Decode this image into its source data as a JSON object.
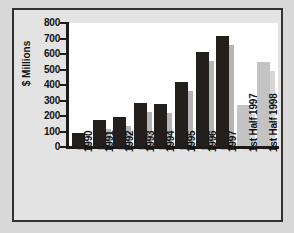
{
  "chart_data": {
    "type": "bar",
    "title": "",
    "xlabel": "",
    "ylabel": "$ Millions",
    "ylim": [
      0,
      800
    ],
    "ytick_labels": [
      "800",
      "700",
      "600",
      "500",
      "400",
      "300",
      "200",
      "100",
      "0"
    ],
    "yticks": [
      800,
      700,
      600,
      500,
      400,
      300,
      200,
      100,
      0
    ],
    "grid": false,
    "legend": "none",
    "categories": [
      "1990",
      "1991",
      "1992",
      "1993",
      "1994",
      "1995",
      "1996",
      "1997",
      "1st Half 1997",
      "1st Half 1998"
    ],
    "values": [
      90,
      175,
      195,
      285,
      278,
      420,
      615,
      715,
      270,
      550
    ],
    "bar_styles": [
      "dark",
      "dark",
      "dark",
      "dark",
      "dark",
      "dark",
      "dark",
      "dark",
      "light",
      "light"
    ],
    "series": [
      {
        "name": "Revenue",
        "values": [
          90,
          175,
          195,
          285,
          278,
          420,
          615,
          715,
          270,
          550
        ]
      }
    ]
  },
  "colors": {
    "bar_dark": "#231f1d",
    "bar_light": "#c3c3c3",
    "shadow_dark": "#b4b4b4",
    "shadow_light": "#d6d6d6",
    "axis": "#1d1a18",
    "frame_border": "#33302e",
    "frame_background": "#e3e3e3",
    "plot_background": "#ffffff",
    "page_background": "#d8d8d8"
  }
}
